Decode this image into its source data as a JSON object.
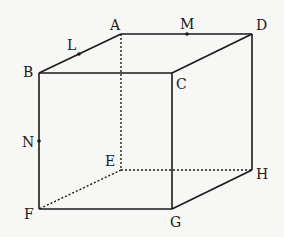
{
  "diagram": {
    "type": "cube",
    "vertices": {
      "A": {
        "label": "A",
        "x": 121,
        "y": 34
      },
      "B": {
        "label": "B",
        "x": 39,
        "y": 73
      },
      "C": {
        "label": "C",
        "x": 172,
        "y": 73
      },
      "D": {
        "label": "D",
        "x": 252,
        "y": 34
      },
      "E": {
        "label": "E",
        "x": 121,
        "y": 170
      },
      "F": {
        "label": "F",
        "x": 39,
        "y": 209
      },
      "G": {
        "label": "G",
        "x": 172,
        "y": 209
      },
      "H": {
        "label": "H",
        "x": 252,
        "y": 170
      }
    },
    "points": {
      "L": {
        "label": "L",
        "on_edge": "AB",
        "x": 79,
        "y": 54
      },
      "M": {
        "label": "M",
        "on_edge": "AD",
        "x": 187,
        "y": 34
      },
      "N": {
        "label": "N",
        "on_edge": "BF",
        "x": 39,
        "y": 141
      }
    },
    "solid_edges": [
      "AB",
      "AD",
      "BC",
      "CD",
      "BF",
      "CG",
      "DH",
      "FG",
      "GH"
    ],
    "hidden_edges": [
      "AE",
      "EF",
      "EH"
    ],
    "colors": {
      "line": "#1a1a1a",
      "background": "#f7f7f5"
    }
  }
}
